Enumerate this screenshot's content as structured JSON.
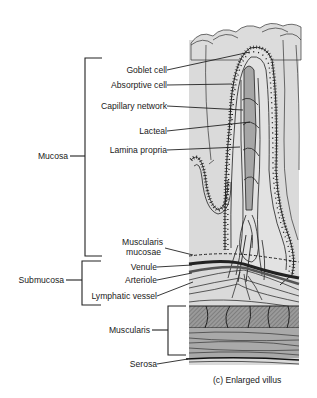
{
  "diagram": {
    "caption": "(c)  Enlarged villus",
    "colors": {
      "background": "#ffffff",
      "tissue_fill": "#d9d9d9",
      "tissue_dark": "#a8a8a8",
      "line": "#1a1a1a"
    },
    "layers": [
      {
        "id": "mucosa",
        "label": "Mucosa"
      },
      {
        "id": "submucosa",
        "label": "Submucosa"
      },
      {
        "id": "muscularis",
        "label": "Muscularis"
      },
      {
        "id": "serosa",
        "label": "Serosa"
      }
    ],
    "structures": [
      {
        "id": "goblet-cell",
        "label": "Goblet cell"
      },
      {
        "id": "absorptive-cell",
        "label": "Absorptive cell"
      },
      {
        "id": "capillary-network",
        "label": "Capillary network"
      },
      {
        "id": "lacteal",
        "label": "Lacteal"
      },
      {
        "id": "lamina-propria",
        "label": "Lamina propria"
      },
      {
        "id": "muscularis-mucosae",
        "label_line1": "Muscularis",
        "label_line2": "mucosae"
      },
      {
        "id": "venule",
        "label": "Venule"
      },
      {
        "id": "arteriole",
        "label": "Arteriole"
      },
      {
        "id": "lymphatic-vessel",
        "label": "Lymphatic vessel"
      }
    ]
  }
}
